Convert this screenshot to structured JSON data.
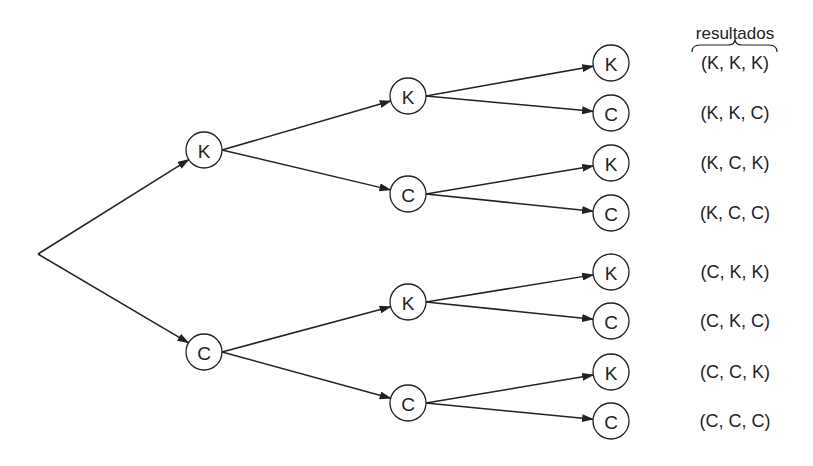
{
  "diagram": {
    "type": "probability-tree",
    "header": "resultados",
    "root": {
      "x": 38,
      "y": 254
    },
    "node_radius": 18,
    "colors": {
      "stroke": "#222222",
      "background": "#ffffff"
    },
    "nodes": [
      {
        "id": "L1-K",
        "label": "K",
        "x": 204,
        "y": 150,
        "parent": "root"
      },
      {
        "id": "L1-C",
        "label": "C",
        "x": 204,
        "y": 352,
        "parent": "root"
      },
      {
        "id": "L2-KK",
        "label": "K",
        "x": 408,
        "y": 96,
        "parent": "L1-K"
      },
      {
        "id": "L2-KC",
        "label": "C",
        "x": 408,
        "y": 194,
        "parent": "L1-K"
      },
      {
        "id": "L2-CK",
        "label": "K",
        "x": 408,
        "y": 302,
        "parent": "L1-C"
      },
      {
        "id": "L2-CC",
        "label": "C",
        "x": 408,
        "y": 403,
        "parent": "L1-C"
      },
      {
        "id": "L3-KKK",
        "label": "K",
        "x": 611,
        "y": 63,
        "parent": "L2-KK"
      },
      {
        "id": "L3-KKC",
        "label": "C",
        "x": 611,
        "y": 113,
        "parent": "L2-KK"
      },
      {
        "id": "L3-KCK",
        "label": "K",
        "x": 611,
        "y": 163,
        "parent": "L2-KC"
      },
      {
        "id": "L3-KCC",
        "label": "C",
        "x": 611,
        "y": 213,
        "parent": "L2-KC"
      },
      {
        "id": "L3-CKK",
        "label": "K",
        "x": 611,
        "y": 272,
        "parent": "L2-CK"
      },
      {
        "id": "L3-CKC",
        "label": "C",
        "x": 611,
        "y": 321,
        "parent": "L2-CK"
      },
      {
        "id": "L3-CCK",
        "label": "K",
        "x": 611,
        "y": 372,
        "parent": "L2-CC"
      },
      {
        "id": "L3-CCC",
        "label": "C",
        "x": 611,
        "y": 421,
        "parent": "L2-CC"
      }
    ],
    "outcomes": [
      {
        "text": "(K, K, K)",
        "y": 63
      },
      {
        "text": "(K, K, C)",
        "y": 113
      },
      {
        "text": "(K, C, K)",
        "y": 163
      },
      {
        "text": "(K, C, C)",
        "y": 213
      },
      {
        "text": "(C, K, K)",
        "y": 272
      },
      {
        "text": "(C, K, C)",
        "y": 321
      },
      {
        "text": "(C, C, K)",
        "y": 372
      },
      {
        "text": "(C, C, C)",
        "y": 421
      }
    ]
  }
}
